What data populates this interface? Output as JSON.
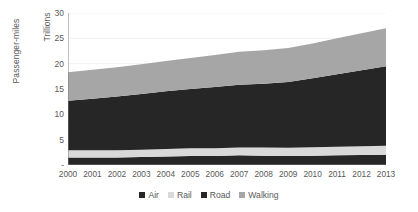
{
  "chart_data": {
    "type": "area",
    "stacked": true,
    "title": "",
    "subtitle": "",
    "xlabel": "",
    "ylabel": "Passenger-miles",
    "units_label": "Trillions",
    "grid": true,
    "legend_position": "bottom",
    "ylim": [
      0,
      30
    ],
    "ytick_values": [
      0,
      5,
      10,
      15,
      20,
      25,
      30
    ],
    "ytick_labels": [
      "-",
      "5",
      "10",
      "15",
      "20",
      "25",
      "30"
    ],
    "categories": [
      "2000",
      "2001",
      "2002",
      "2003",
      "2004",
      "2005",
      "2006",
      "2007",
      "2008",
      "2009",
      "2010",
      "2011",
      "2012",
      "2013"
    ],
    "series": [
      {
        "name": "Air",
        "color": "#262626",
        "values": [
          1.5,
          1.5,
          1.5,
          1.6,
          1.7,
          1.8,
          1.8,
          1.9,
          1.85,
          1.8,
          1.85,
          1.9,
          1.95,
          2.0
        ]
      },
      {
        "name": "Rail",
        "color": "#d9d9d9",
        "values": [
          1.4,
          1.4,
          1.4,
          1.4,
          1.45,
          1.5,
          1.5,
          1.55,
          1.6,
          1.6,
          1.65,
          1.7,
          1.75,
          1.8
        ]
      },
      {
        "name": "Road",
        "color": "#262626",
        "values": [
          9.8,
          10.2,
          10.6,
          11.0,
          11.4,
          11.7,
          12.1,
          12.4,
          12.6,
          13.0,
          13.6,
          14.3,
          15.0,
          15.7
        ]
      },
      {
        "name": "Walking",
        "color": "#a6a6a6",
        "values": [
          5.6,
          5.7,
          5.8,
          5.9,
          6.0,
          6.1,
          6.3,
          6.5,
          6.6,
          6.7,
          6.9,
          7.1,
          7.3,
          7.5
        ]
      }
    ],
    "totals": [
      18.3,
      18.8,
      19.3,
      19.9,
      20.55,
      21.1,
      21.7,
      22.35,
      22.65,
      23.1,
      24.0,
      25.0,
      26.0,
      27.0
    ]
  },
  "legend": {
    "items": [
      {
        "label": "Air"
      },
      {
        "label": "Rail"
      },
      {
        "label": "Road"
      },
      {
        "label": "Walking"
      }
    ]
  }
}
